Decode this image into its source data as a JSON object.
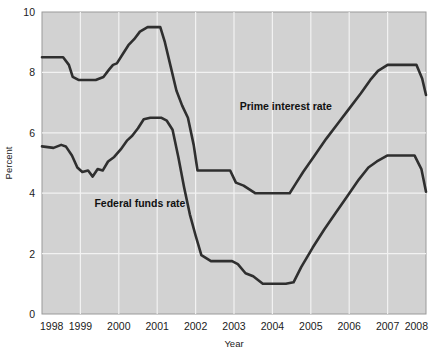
{
  "chart_data": {
    "type": "line",
    "title": "",
    "xlabel": "Year",
    "ylabel": "Percent",
    "xlim": [
      1998,
      2008
    ],
    "ylim": [
      0,
      10
    ],
    "xticks": [
      "1998",
      "1999",
      "2000",
      "2001",
      "2002",
      "2003",
      "2004",
      "2005",
      "2006",
      "2007",
      "2008"
    ],
    "yticks": [
      "0",
      "2",
      "4",
      "6",
      "8",
      "10"
    ],
    "grid": true,
    "legend_position": "inline-annotation",
    "plot_background": "#d2d2d2",
    "gridline_color": "#f2f2f2",
    "line_color": "#2f2f2f",
    "series": [
      {
        "name": "Prime interest rate",
        "label_x": 2004.35,
        "label_y": 6.75,
        "x": [
          1998.0,
          1998.55,
          1998.7,
          1998.8,
          1998.95,
          1999.4,
          1999.6,
          1999.75,
          1999.85,
          1999.95,
          2000.1,
          2000.25,
          2000.4,
          2000.55,
          2000.75,
          2001.0,
          2001.08,
          2001.2,
          2001.35,
          2001.5,
          2001.65,
          2001.8,
          2001.95,
          2002.05,
          2002.25,
          2002.6,
          2002.9,
          2003.05,
          2003.25,
          2003.55,
          2003.8,
          2004.1,
          2004.45,
          2004.6,
          2004.8,
          2005.1,
          2005.4,
          2005.7,
          2006.0,
          2006.3,
          2006.55,
          2006.75,
          2007.0,
          2007.4,
          2007.75,
          2007.9,
          2008.0
        ],
        "y": [
          8.5,
          8.5,
          8.25,
          7.85,
          7.75,
          7.75,
          7.85,
          8.1,
          8.25,
          8.3,
          8.6,
          8.9,
          9.1,
          9.35,
          9.5,
          9.5,
          9.5,
          9.0,
          8.2,
          7.4,
          6.9,
          6.5,
          5.6,
          4.75,
          4.75,
          4.75,
          4.75,
          4.35,
          4.25,
          4.0,
          4.0,
          4.0,
          4.0,
          4.3,
          4.7,
          5.25,
          5.8,
          6.3,
          6.8,
          7.3,
          7.75,
          8.05,
          8.25,
          8.25,
          8.25,
          7.8,
          7.25
        ]
      },
      {
        "name": "Federal funds rate",
        "label_x": 2000.55,
        "label_y": 3.55,
        "x": [
          1998.0,
          1998.3,
          1998.5,
          1998.62,
          1998.78,
          1998.92,
          1999.05,
          1999.2,
          1999.32,
          1999.45,
          1999.58,
          1999.72,
          1999.88,
          2000.05,
          2000.22,
          2000.35,
          2000.5,
          2000.65,
          2000.82,
          2001.0,
          2001.1,
          2001.25,
          2001.4,
          2001.55,
          2001.7,
          2001.85,
          2002.0,
          2002.15,
          2002.4,
          2002.75,
          2002.95,
          2003.1,
          2003.3,
          2003.5,
          2003.75,
          2004.05,
          2004.35,
          2004.55,
          2004.75,
          2005.05,
          2005.35,
          2005.65,
          2005.95,
          2006.25,
          2006.5,
          2006.72,
          2007.0,
          2007.35,
          2007.7,
          2007.88,
          2008.0
        ],
        "y": [
          5.55,
          5.5,
          5.6,
          5.55,
          5.25,
          4.85,
          4.7,
          4.75,
          4.55,
          4.8,
          4.75,
          5.05,
          5.2,
          5.45,
          5.75,
          5.9,
          6.15,
          6.45,
          6.5,
          6.5,
          6.5,
          6.4,
          6.1,
          5.2,
          4.2,
          3.3,
          2.6,
          1.95,
          1.75,
          1.75,
          1.75,
          1.65,
          1.35,
          1.25,
          1.0,
          1.0,
          1.0,
          1.05,
          1.55,
          2.2,
          2.8,
          3.35,
          3.9,
          4.45,
          4.85,
          5.05,
          5.25,
          5.25,
          5.25,
          4.8,
          4.05
        ]
      }
    ]
  },
  "axes": {
    "y_title": "Percent",
    "x_title": "Year"
  }
}
